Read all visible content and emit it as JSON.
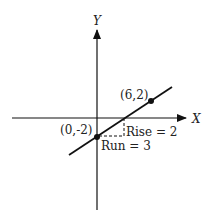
{
  "diagram": {
    "type": "coordinate-plane-slope",
    "axes": {
      "x_label": "X",
      "y_label": "Y"
    },
    "line": {
      "description": "line through (0,-2) and (6,2)",
      "slope": "2/3"
    },
    "points": [
      {
        "label": "(6,2)",
        "x": 6,
        "y": 2
      },
      {
        "label": "(0,-2)",
        "x": 0,
        "y": -2
      }
    ],
    "annotations": {
      "rise": "Rise = 2",
      "run": "Run = 3"
    },
    "colors": {
      "ink": "#111111",
      "background": "#ffffff"
    }
  }
}
